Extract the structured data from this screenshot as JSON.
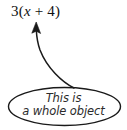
{
  "figure": {
    "background_color": "#ffffff",
    "stroke_color": "#1a1a1a",
    "text_color": "#2b2b2b"
  },
  "expression": {
    "full": "3(x + 4)",
    "coefficient": "3",
    "open_paren": "(",
    "variable": "x",
    "operator": "+",
    "constant": "4",
    "close_paren": ")"
  },
  "annotation": {
    "shape": "ellipse",
    "line_1": "This is",
    "line_2": "a whole object",
    "full_text": "This is a whole object"
  },
  "arrow": {
    "name": "curved-arrow",
    "direction": "up",
    "points_to": "3(x + 4)",
    "origin": "ellipse-annotation"
  }
}
